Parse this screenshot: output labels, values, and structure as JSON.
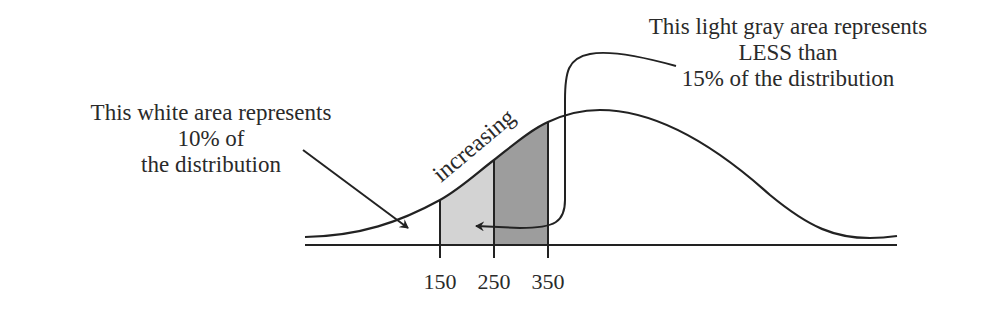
{
  "diagram": {
    "type": "normal-distribution-annotated",
    "left_annotation": {
      "lines": [
        "This white area represents",
        "10% of",
        "the distribution"
      ]
    },
    "right_annotation": {
      "lines": [
        "This light gray area represents",
        "LESS than",
        "15% of the distribution"
      ]
    },
    "slope_label": "increasing",
    "x_ticks": [
      {
        "value": "150",
        "x": 440
      },
      {
        "value": "250",
        "x": 494
      },
      {
        "value": "350",
        "x": 548
      }
    ],
    "regions": [
      {
        "name": "white-tail",
        "range": "below 150",
        "fill": "#ffffff",
        "share": "10%"
      },
      {
        "name": "light-gray",
        "range": "150-250",
        "fill": "#d3d3d3",
        "share": "less than 15%"
      },
      {
        "name": "dark-gray",
        "range": "250-350",
        "fill": "#9d9d9d"
      }
    ],
    "colors": {
      "stroke": "#222222",
      "light_gray": "#d3d3d3",
      "dark_gray": "#9d9d9d",
      "text": "#2a2a2a"
    }
  }
}
